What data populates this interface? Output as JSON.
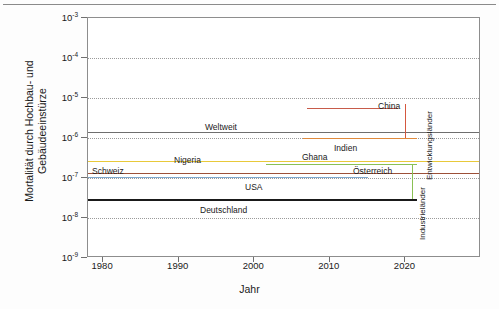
{
  "chart_data": {
    "type": "line",
    "title": "",
    "xlabel": "Jahr",
    "ylabel": "Mortalität durch Hochbau- und Gebäudeeinstürze",
    "ylabel_line1": "Mortalität durch Hochbau- und",
    "ylabel_line2": "Gebäudeeinstürze",
    "xlim": [
      1978,
      2030
    ],
    "ylim_exp": [
      -9,
      -3
    ],
    "yscale": "log",
    "grid": "horizontal-dotted",
    "legend": "inline-labels",
    "yticks": [
      {
        "exp": "-3",
        "mantissa": "10"
      },
      {
        "exp": "-4",
        "mantissa": "10"
      },
      {
        "exp": "-5",
        "mantissa": "10"
      },
      {
        "exp": "-6",
        "mantissa": "10"
      },
      {
        "exp": "-7",
        "mantissa": "10"
      },
      {
        "exp": "-8",
        "mantissa": "10"
      },
      {
        "exp": "-9",
        "mantissa": "10"
      }
    ],
    "xticks": [
      "1980",
      "1990",
      "2000",
      "2010",
      "2020"
    ],
    "series": [
      {
        "name": "China",
        "label": "China",
        "color": "#c75b4a",
        "x_start": 2007.0,
        "x_end": 2019.0,
        "value": 5.5e-06,
        "width": 1.6,
        "label_x": 378,
        "label_y": 101,
        "label_anchor": "left"
      },
      {
        "name": "Weltweit",
        "label": "Weltweit",
        "color": "#6e6e6e",
        "x_start": 1978.0,
        "x_end": 2030.0,
        "value": 1.45e-06,
        "width": 1.6,
        "label_x": 205,
        "label_y": 122,
        "label_anchor": "left"
      },
      {
        "name": "Indien",
        "label": "Indien",
        "color": "#e08a3c",
        "x_start": 2006.5,
        "x_end": 2021.5,
        "value": 1.02e-06,
        "width": 1.8,
        "label_x": 334,
        "label_y": 143,
        "label_anchor": "left"
      },
      {
        "name": "Nigeria",
        "label": "Nigeria",
        "color": "#e8c93a",
        "x_start": 1978.0,
        "x_end": 2030.0,
        "value": 2.6e-07,
        "width": 1.6,
        "label_x": 174,
        "label_y": 155,
        "label_anchor": "left"
      },
      {
        "name": "Ghana",
        "label": "Ghana",
        "color": "#8ac054",
        "x_start": 2001.5,
        "x_end": 2021.5,
        "value": 2.25e-07,
        "width": 1.8,
        "label_x": 302,
        "label_y": 152,
        "label_anchor": "left"
      },
      {
        "name": "Schweiz",
        "label": "Schweiz",
        "color": "#9c5038",
        "x_start": 1978.0,
        "x_end": 2030.0,
        "value": 1.35e-07,
        "width": 1.6,
        "label_x": 92,
        "label_y": 166,
        "label_anchor": "left"
      },
      {
        "name": "Oesterreich",
        "label": "Österreich",
        "color": "#9c5038",
        "x_start": 1978.0,
        "x_end": 2030.0,
        "value": 1.35e-07,
        "width": 0,
        "label_x": 353,
        "label_y": 166,
        "label_anchor": "left"
      },
      {
        "name": "USA",
        "label": "USA",
        "color": "#7fa8cd",
        "x_start": 1978.0,
        "x_end": 2015.0,
        "value": 1.08e-07,
        "width": 1.8,
        "label_x": 245,
        "label_y": 182,
        "label_anchor": "left"
      },
      {
        "name": "Deutschland",
        "label": "Deutschland",
        "color": "#1a1a1a",
        "x_start": 1978.0,
        "x_end": 2021.5,
        "value": 3e-08,
        "width": 2.4,
        "label_x": 200,
        "label_y": 205,
        "label_anchor": "left"
      }
    ],
    "brackets": [
      {
        "name": "Entwicklungslaender",
        "label": "Entwicklungsländer",
        "color": "#d4583f",
        "x_pixel": 404,
        "value_low": 1e-06,
        "value_high": 7e-06,
        "label_x": 425,
        "label_y": 180
      },
      {
        "name": "Industrielaender",
        "label": "Industrieländer",
        "color": "#8ac054",
        "x_pixel": 411,
        "value_low": 3e-08,
        "value_high": 2.3e-07,
        "label_x": 418,
        "label_y": 240
      }
    ]
  }
}
